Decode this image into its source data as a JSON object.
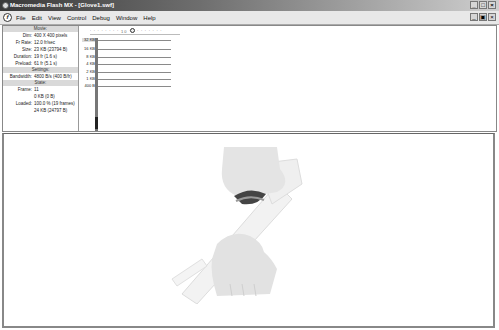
{
  "window": {
    "title": "Macromedia Flash MX - [Glove1.swf]",
    "controls": [
      "_",
      "□",
      "×"
    ],
    "doc_controls": [
      "_",
      "▣",
      "×"
    ]
  },
  "menu": {
    "items": [
      "File",
      "Edit",
      "View",
      "Control",
      "Debug",
      "Window",
      "Help"
    ]
  },
  "bandwidth_profiler": {
    "movie_header": "Movie:",
    "movie": [
      {
        "k": "Dim:",
        "v": "400 X 400 pixels"
      },
      {
        "k": "Fr Rate:",
        "v": "12.0 fr/sec"
      },
      {
        "k": "Size:",
        "v": "23 KB (23794 B)"
      },
      {
        "k": "Duration:",
        "v": "19 fr (1.6 s)"
      },
      {
        "k": "Preload:",
        "v": "61 fr (5.1 s)"
      }
    ],
    "settings_header": "Settings:",
    "settings": [
      {
        "k": "Bandwidth:",
        "v": "4800 B/s (400 B/fr)"
      }
    ],
    "state_header": "State:",
    "state": [
      {
        "k": "Frame:",
        "v": "11"
      },
      {
        "k": "",
        "v": "0 KB (0 B)"
      },
      {
        "k": "Loaded:",
        "v": "100.0 % (19 frames)"
      },
      {
        "k": "",
        "v": "24 KB (24797 B)"
      }
    ],
    "y_labels": [
      "32 KB",
      "16 KB",
      "8 KB",
      "4 KB",
      "2 KB",
      "1 KB",
      "400 B"
    ],
    "ruler_ticks": "' ' ' ' ' ' ' ' 10 ' ' ' ' ' ' ' ' '",
    "current_frame": 11
  },
  "stage": {
    "content": "glove-animation"
  }
}
